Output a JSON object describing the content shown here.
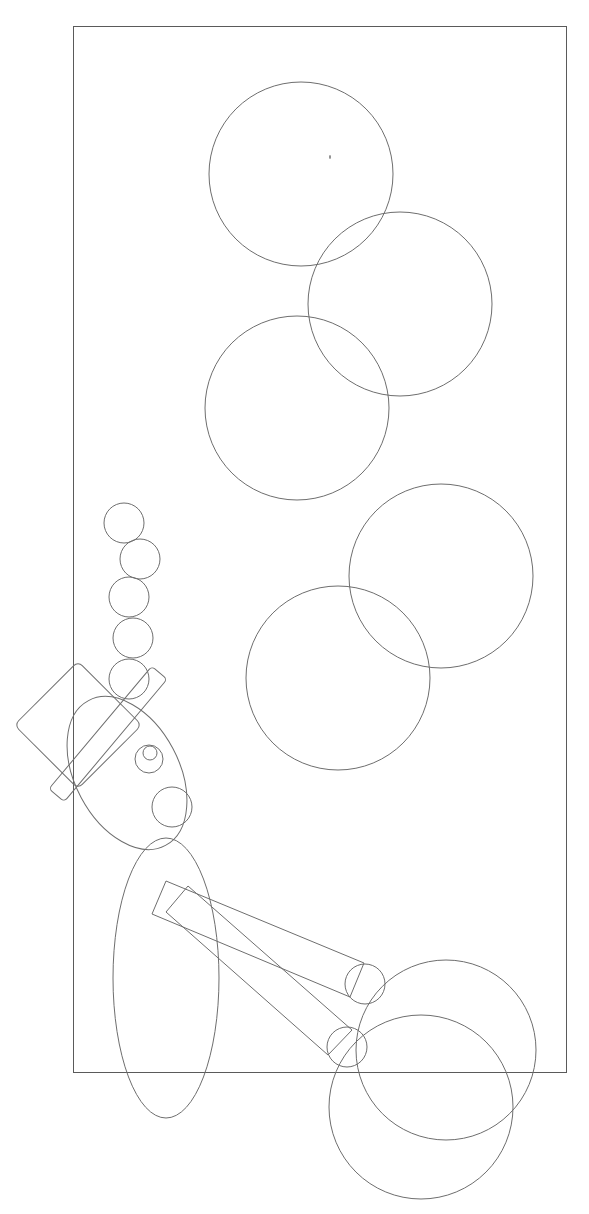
{
  "diagram": {
    "type": "line-drawing",
    "stroke_color": "#6e6e6e",
    "frame_color": "#5a5a5a",
    "background": "#ffffff",
    "frame": {
      "x": 73,
      "y": 26,
      "width": 493,
      "height": 1046
    },
    "large_circles": [
      {
        "cx": 301,
        "cy": 174,
        "r": 92
      },
      {
        "cx": 400,
        "cy": 304,
        "r": 92
      },
      {
        "cx": 297,
        "cy": 408,
        "r": 92
      },
      {
        "cx": 441,
        "cy": 576,
        "r": 92
      },
      {
        "cx": 338,
        "cy": 678,
        "r": 92
      },
      {
        "cx": 446,
        "cy": 1050,
        "r": 90
      },
      {
        "cx": 421,
        "cy": 1107,
        "r": 92
      }
    ],
    "small_circle_chain": [
      {
        "cx": 124,
        "cy": 523,
        "r": 20
      },
      {
        "cx": 140,
        "cy": 559,
        "r": 20
      },
      {
        "cx": 129,
        "cy": 597,
        "r": 20
      },
      {
        "cx": 133,
        "cy": 638,
        "r": 20
      },
      {
        "cx": 129,
        "cy": 679,
        "r": 20
      }
    ],
    "joint_circles": [
      {
        "cx": 365,
        "cy": 984,
        "r": 20
      },
      {
        "cx": 347,
        "cy": 1047,
        "r": 20
      }
    ],
    "ellipses": [
      {
        "name": "head-ellipse",
        "cx": 127,
        "cy": 773,
        "rx": 52,
        "ry": 82,
        "rotate": -28
      },
      {
        "name": "body-ellipse",
        "cx": 166,
        "cy": 978,
        "rx": 53,
        "ry": 140,
        "rotate": 0
      }
    ],
    "face_details": [
      {
        "cx": 149,
        "cy": 759,
        "r": 14
      },
      {
        "cx": 150,
        "cy": 753,
        "r": 7
      },
      {
        "cx": 172,
        "cy": 807,
        "r": 20
      }
    ]
  }
}
